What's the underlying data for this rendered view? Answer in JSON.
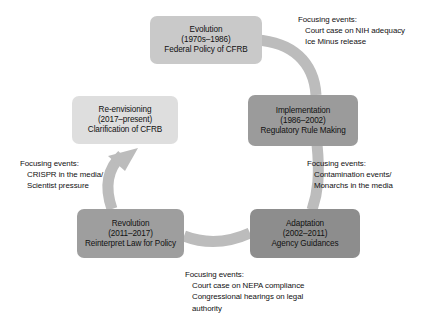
{
  "diagram": {
    "type": "cycle-diagram",
    "direction": "counter-clockwise",
    "colors": {
      "evolution_box": "#c9c9c9",
      "implementation_box": "#9b9b9b",
      "adaptation_box": "#8d8d8d",
      "revolution_box": "#9e9e9e",
      "reenvisioning_box": "#dedede",
      "arrow_band": "#b9b9b9",
      "text": "#111111",
      "background": "#ffffff"
    },
    "stages": [
      {
        "id": "evolution",
        "name": "Evolution",
        "period": "(1970s–1986)",
        "descriptor": "Federal Policy of CFRB"
      },
      {
        "id": "implementation",
        "name": "Implementation",
        "period": "(1986–2002)",
        "descriptor": "Regulatory Rule Making"
      },
      {
        "id": "adaptation",
        "name": "Adaptation",
        "period": "(2002–2011)",
        "descriptor": "Agency Guidances"
      },
      {
        "id": "revolution",
        "name": "Revolution",
        "period": "(2011–2017)",
        "descriptor": "Reinterpret Law for Policy"
      },
      {
        "id": "reenvisioning",
        "name": "Re-envisioning",
        "period": "(2017–present)",
        "descriptor": "Clarification of CFRB"
      }
    ],
    "notes": [
      {
        "id": "evolution-to-implementation",
        "header": "Focusing events:",
        "items": [
          "Court case on NIH adequacy",
          "Ice Minus release"
        ]
      },
      {
        "id": "implementation-to-adaptation",
        "header": "Focusing events:",
        "items": [
          "Contamination events/",
          "Monarchs in the media"
        ]
      },
      {
        "id": "adaptation-to-revolution",
        "header": "Focusing events:",
        "items": [
          "Court case on NEPA compliance",
          "Congressional hearings on legal",
          "authority"
        ]
      },
      {
        "id": "revolution-to-reenvisioning",
        "header": "Focusing events:",
        "items": [
          "CRISPR in the media/",
          "Scientist pressure"
        ]
      }
    ]
  }
}
